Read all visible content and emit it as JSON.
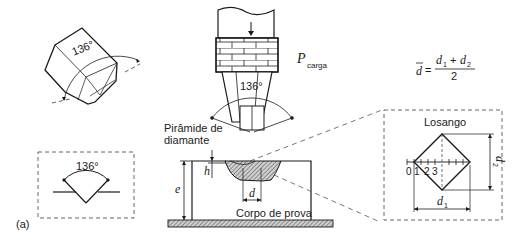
{
  "figure_label": "(a)",
  "angle_label": "136°",
  "load": {
    "symbol": "P",
    "subscript": "carga"
  },
  "formula": {
    "lhs": "d",
    "equals": "=",
    "numerator_a": "d",
    "numerator_a_sub": "1",
    "plus": "+",
    "numerator_b": "d",
    "numerator_b_sub": "2",
    "denominator": "2"
  },
  "indenter_label_line1": "Pirâmide de",
  "indenter_label_line2": "diamante",
  "specimen": {
    "label": "Corpo de prova",
    "thickness_symbol": "e",
    "depth_symbol": "h",
    "diagonal_symbol": "d"
  },
  "losango": {
    "title": "Losango",
    "scale_ticks": [
      "0",
      "1",
      "2",
      "3"
    ],
    "d1": "d",
    "d1_sub": "1",
    "d2": "d",
    "d2_sub": "2"
  },
  "colors": {
    "line": "#1a1a1a",
    "hatch": "#555555",
    "dashed": "#555555"
  }
}
